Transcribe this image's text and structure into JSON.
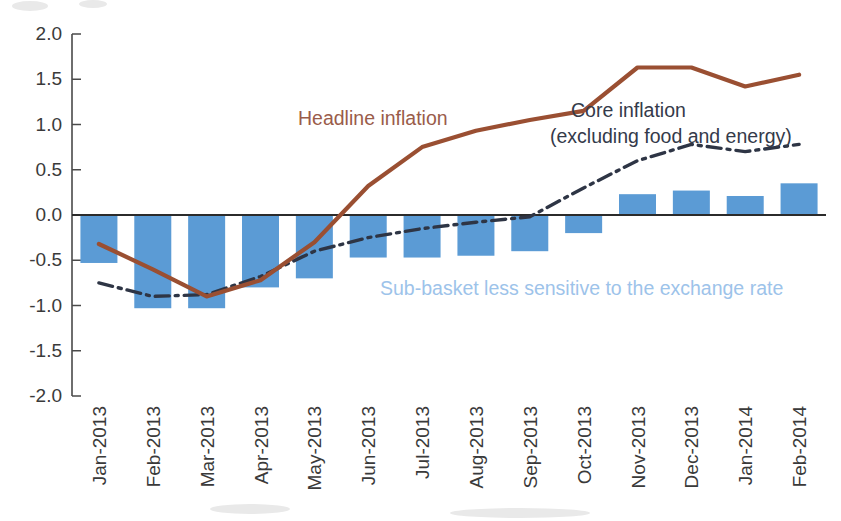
{
  "chart_data": {
    "type": "bar",
    "title": "",
    "subtitle": "",
    "xlabel": "",
    "ylabel": "",
    "ylim": [
      -2.0,
      2.0
    ],
    "grid": false,
    "legend_position": "inline-annotations",
    "categories": [
      "Jan-2013",
      "Feb-2013",
      "Mar-2013",
      "Apr-2013",
      "May-2013",
      "Jun-2013",
      "Jul-2013",
      "Aug-2013",
      "Sep-2013",
      "Oct-2013",
      "Nov-2013",
      "Dec-2013",
      "Jan-2014",
      "Feb-2014"
    ],
    "ytick_labels": [
      "2.0",
      "1.5",
      "1.0",
      "0.5",
      "0.0",
      "-0.5",
      "-1.0",
      "-1.5",
      "-2.0"
    ],
    "ytick_values": [
      2.0,
      1.5,
      1.0,
      0.5,
      0.0,
      -0.5,
      -1.0,
      -1.5,
      -2.0
    ],
    "series": [
      {
        "name": "Sub-basket less sensitive to the exchange rate",
        "type": "bar",
        "color": "#5b9bd5",
        "values": [
          -0.53,
          -1.03,
          -1.03,
          -0.8,
          -0.7,
          -0.47,
          -0.47,
          -0.45,
          -0.4,
          -0.2,
          0.23,
          0.27,
          0.21,
          0.35
        ]
      },
      {
        "name": "Headline inflation",
        "type": "line",
        "color": "#9a4f32",
        "style": "solid",
        "values": [
          -0.32,
          -0.6,
          -0.9,
          -0.72,
          -0.3,
          0.32,
          0.75,
          0.93,
          1.05,
          1.15,
          1.63,
          1.63,
          1.42,
          1.55
        ]
      },
      {
        "name": "Core inflation (excluding food and energy)",
        "type": "line",
        "color": "#2e3545",
        "style": "dash-dot",
        "values": [
          -0.75,
          -0.9,
          -0.88,
          -0.68,
          -0.4,
          -0.25,
          -0.15,
          -0.08,
          -0.02,
          0.3,
          0.6,
          0.78,
          0.7,
          0.78
        ]
      }
    ],
    "annotations": [
      {
        "id": "headline",
        "text": "Headline inflation",
        "color": "#9a5c4a"
      },
      {
        "id": "core_line1",
        "text": "Core inflation",
        "color": "#343a4a"
      },
      {
        "id": "core_line2",
        "text": "(excluding food and energy)",
        "color": "#343a4a"
      },
      {
        "id": "subbasket",
        "text": "Sub-basket less sensitive to the exchange rate",
        "color": "#9dc3ea"
      }
    ]
  },
  "axis": {
    "y_labels": [
      "2.0",
      "1.5",
      "1.0",
      "0.5",
      "0.0",
      "-0.5",
      "-1.0",
      "-1.5",
      "-2.0"
    ],
    "x_labels": [
      "Jan-2013",
      "Feb-2013",
      "Mar-2013",
      "Apr-2013",
      "May-2013",
      "Jun-2013",
      "Jul-2013",
      "Aug-2013",
      "Sep-2013",
      "Oct-2013",
      "Nov-2013",
      "Dec-2013",
      "Jan-2014",
      "Feb-2014"
    ]
  },
  "annotations": {
    "headline": "Headline inflation",
    "core_line1": "Core inflation",
    "core_line2": "(excluding food and energy)",
    "subbasket": "Sub-basket less sensitive to the exchange rate"
  },
  "colors": {
    "bar": "#5b9bd5",
    "headline": "#9a4f32",
    "core": "#2e3545",
    "subbasket_label": "#9dc3ea",
    "axis": "#4a4a4a"
  }
}
